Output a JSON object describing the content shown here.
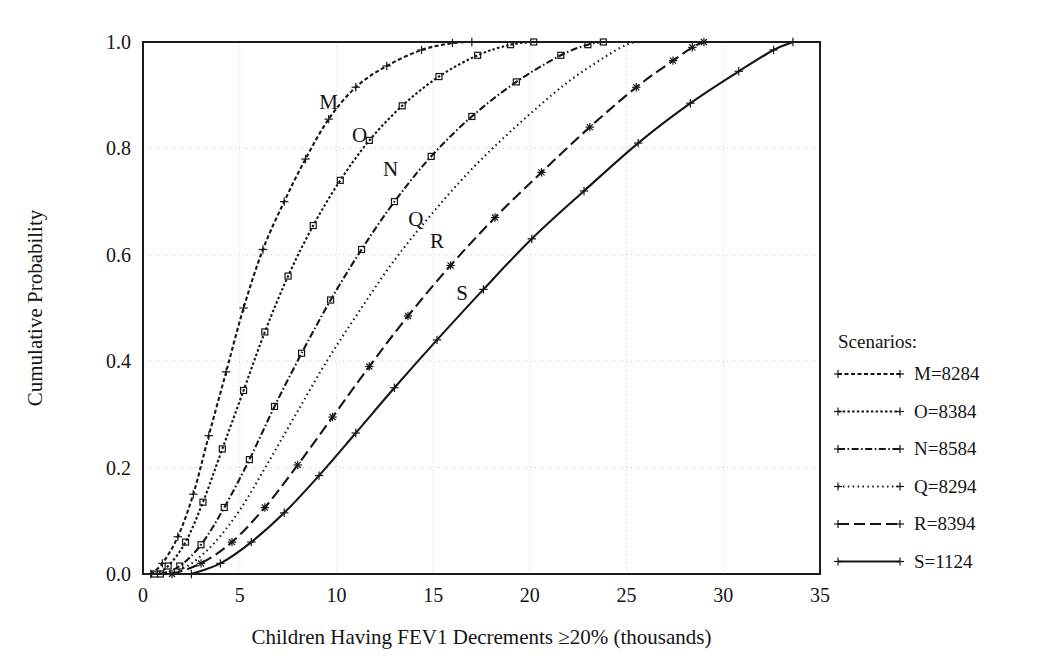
{
  "figure": {
    "background_color": "#ffffff",
    "ink_color": "#16161a",
    "grid_color": "#c9c9c9"
  },
  "axes": {
    "x_title": "Children Having FEV1 Decrements ≥20% (thousands)",
    "y_title": "Cumulative Probability",
    "x_ticks": [
      "0",
      "5",
      "10",
      "15",
      "20",
      "25",
      "30",
      "35"
    ],
    "y_ticks": [
      "0.0",
      "0.2",
      "0.4",
      "0.6",
      "0.8",
      "1.0"
    ]
  },
  "legend": {
    "title": "Scenarios:",
    "entries": [
      {
        "key": "M",
        "label": "M=8284",
        "style": "fine-dash"
      },
      {
        "key": "O",
        "label": "O=8384",
        "style": "dense-dot"
      },
      {
        "key": "N",
        "label": "N=8584",
        "style": "dash-dot"
      },
      {
        "key": "Q",
        "label": "Q=8294",
        "style": "dotted"
      },
      {
        "key": "R",
        "label": "R=8394",
        "style": "long-dash"
      },
      {
        "key": "S",
        "label": "S=1124",
        "style": "solid"
      }
    ]
  },
  "curve_tags": [
    {
      "text": "M",
      "x": 9.6,
      "y": 0.875
    },
    {
      "text": "O",
      "x": 11.2,
      "y": 0.812
    },
    {
      "text": "N",
      "x": 12.8,
      "y": 0.748
    },
    {
      "text": "Q",
      "x": 14.1,
      "y": 0.655
    },
    {
      "text": "R",
      "x": 15.2,
      "y": 0.612
    },
    {
      "text": "S",
      "x": 16.5,
      "y": 0.515
    }
  ],
  "chart_data": {
    "type": "line",
    "title": "",
    "subtitle": "",
    "xlabel": "Children Having FEV1 Decrements ≥20% (thousands)",
    "ylabel": "Cumulative Probability",
    "xlim": [
      0,
      35
    ],
    "ylim": [
      0.0,
      1.0
    ],
    "xticks": [
      0,
      5,
      10,
      15,
      20,
      25,
      30,
      35
    ],
    "yticks": [
      0.0,
      0.2,
      0.4,
      0.6,
      0.8,
      1.0
    ],
    "grid": true,
    "legend_position": "right-outside",
    "legend_title": "Scenarios:",
    "series": [
      {
        "name": "M=8284",
        "key": "M",
        "linestyle": "fine-dash",
        "marker": "plus",
        "x": [
          0.4,
          1.0,
          1.8,
          2.6,
          3.4,
          4.3,
          5.2,
          6.2,
          7.3,
          8.4,
          9.6,
          11.0,
          12.6,
          14.4,
          16.0,
          17.0
        ],
        "y": [
          0.0,
          0.02,
          0.07,
          0.15,
          0.26,
          0.38,
          0.5,
          0.61,
          0.7,
          0.78,
          0.855,
          0.915,
          0.955,
          0.985,
          0.998,
          1.0
        ]
      },
      {
        "name": "O=8384",
        "key": "O",
        "linestyle": "dense-dot",
        "marker": "square",
        "x": [
          0.6,
          1.3,
          2.2,
          3.1,
          4.1,
          5.2,
          6.3,
          7.5,
          8.8,
          10.2,
          11.7,
          13.4,
          15.3,
          17.3,
          19.0,
          20.2
        ],
        "y": [
          0.0,
          0.015,
          0.06,
          0.135,
          0.235,
          0.345,
          0.455,
          0.56,
          0.655,
          0.74,
          0.815,
          0.88,
          0.935,
          0.975,
          0.995,
          1.0
        ]
      },
      {
        "name": "N=8584",
        "key": "N",
        "linestyle": "dash-dot",
        "marker": "square",
        "x": [
          0.9,
          1.9,
          3.0,
          4.2,
          5.5,
          6.8,
          8.2,
          9.7,
          11.3,
          13.0,
          14.9,
          17.0,
          19.3,
          21.6,
          23.0,
          23.8
        ],
        "y": [
          0.0,
          0.015,
          0.055,
          0.125,
          0.215,
          0.315,
          0.415,
          0.515,
          0.61,
          0.7,
          0.785,
          0.86,
          0.925,
          0.975,
          0.995,
          1.0
        ]
      },
      {
        "name": "Q=8294",
        "key": "Q",
        "linestyle": "dotted",
        "marker": "none",
        "x": [
          1.1,
          2.3,
          3.6,
          5.0,
          6.4,
          7.9,
          9.5,
          11.2,
          13.0,
          15.0,
          17.1,
          19.4,
          21.8,
          23.8,
          25.0,
          25.6
        ],
        "y": [
          0.0,
          0.015,
          0.055,
          0.12,
          0.205,
          0.3,
          0.4,
          0.495,
          0.59,
          0.68,
          0.765,
          0.845,
          0.92,
          0.97,
          0.995,
          1.0
        ]
      },
      {
        "name": "R=8394",
        "key": "R",
        "linestyle": "long-dash",
        "marker": "asterisk",
        "x": [
          1.5,
          3.0,
          4.6,
          6.3,
          8.0,
          9.8,
          11.7,
          13.7,
          15.9,
          18.2,
          20.6,
          23.1,
          25.5,
          27.4,
          28.4,
          29.0
        ],
        "y": [
          0.0,
          0.02,
          0.06,
          0.125,
          0.205,
          0.295,
          0.39,
          0.485,
          0.58,
          0.67,
          0.755,
          0.84,
          0.915,
          0.965,
          0.99,
          1.0
        ]
      },
      {
        "name": "S=1124",
        "key": "S",
        "linestyle": "solid",
        "marker": "plus",
        "x": [
          2.5,
          4.0,
          5.6,
          7.3,
          9.1,
          11.0,
          13.0,
          15.2,
          17.6,
          20.1,
          22.8,
          25.6,
          28.3,
          30.8,
          32.6,
          33.6
        ],
        "y": [
          0.0,
          0.02,
          0.06,
          0.115,
          0.185,
          0.265,
          0.35,
          0.44,
          0.535,
          0.63,
          0.72,
          0.81,
          0.885,
          0.945,
          0.985,
          1.0
        ]
      }
    ]
  }
}
